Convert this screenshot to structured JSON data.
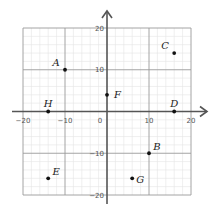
{
  "chart_data": {
    "type": "scatter",
    "title": "",
    "xlabel": "",
    "ylabel": "",
    "xlim": [
      -20,
      20
    ],
    "ylim": [
      -20,
      20
    ],
    "grid": true,
    "major_step": 10,
    "minor_step": 2,
    "x_ticks": [
      -20,
      -10,
      0,
      10,
      20
    ],
    "y_ticks": [
      20,
      10,
      -10,
      -20
    ],
    "x_tick_labels": [
      "−20",
      "−10",
      "0",
      "10",
      "20"
    ],
    "y_tick_labels": [
      "20",
      "10",
      "−10",
      "−20"
    ],
    "points": [
      {
        "label": "A",
        "x": -10,
        "y": 10,
        "label_pos": "upper-left"
      },
      {
        "label": "B",
        "x": 10,
        "y": -10,
        "label_pos": "upper-right"
      },
      {
        "label": "C",
        "x": 16,
        "y": 14,
        "label_pos": "upper-left"
      },
      {
        "label": "D",
        "x": 16,
        "y": 0,
        "label_pos": "above"
      },
      {
        "label": "E",
        "x": -14,
        "y": -16,
        "label_pos": "upper-right"
      },
      {
        "label": "F",
        "x": 0,
        "y": 4,
        "label_pos": "right"
      },
      {
        "label": "G",
        "x": 6,
        "y": -16,
        "label_pos": "lower-right"
      },
      {
        "label": "H",
        "x": -14,
        "y": 0,
        "label_pos": "above"
      }
    ],
    "colors": {
      "axis": "#555555",
      "major_grid": "#9a9a9a",
      "minor_grid": "#e4e4e4",
      "point": "#111111"
    }
  }
}
